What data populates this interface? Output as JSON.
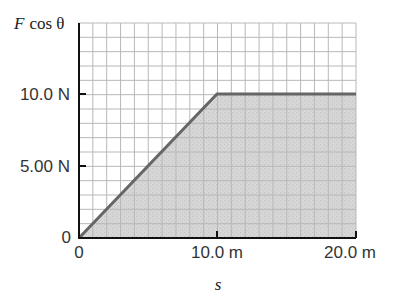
{
  "chart_data": {
    "type": "area",
    "title": "",
    "xlabel": "s",
    "ylabel": "F cos θ",
    "x": [
      0,
      10.0,
      20.0
    ],
    "values": [
      0,
      10.0,
      10.0
    ],
    "series": [
      {
        "name": "F cos θ",
        "x": [
          0,
          10.0,
          20.0
        ],
        "values": [
          0,
          10.0,
          10.0
        ],
        "fill": "shaded area under curve"
      }
    ],
    "x_ticks": [
      {
        "value": 0,
        "label": "0"
      },
      {
        "value": 10.0,
        "label": "10.0 m"
      },
      {
        "value": 20.0,
        "label": "20.0 m"
      }
    ],
    "y_ticks": [
      {
        "value": 0,
        "label": "0"
      },
      {
        "value": 5.0,
        "label": "5.00 N"
      },
      {
        "value": 10.0,
        "label": "10.0 N"
      }
    ],
    "xlim": [
      0,
      20
    ],
    "ylim": [
      0,
      15
    ],
    "grid": true,
    "grid_step_x": 1,
    "grid_step_y": 1,
    "legend": "none"
  },
  "labels": {
    "ylabel_F": "F",
    "ylabel_rest": "cos θ",
    "xlabel": "s",
    "y0": "0",
    "y5": "5.00 N",
    "y10": "10.0 N",
    "x0": "0",
    "x10": "10.0 m",
    "x20": "20.0 m"
  },
  "colors": {
    "line": "#666666",
    "fill": "#d4d4d4",
    "grid": "#bdbdbd",
    "axis": "#111111"
  }
}
